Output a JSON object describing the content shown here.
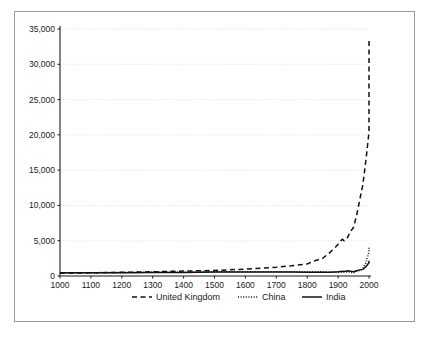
{
  "chart_data": {
    "type": "line",
    "title": "",
    "subtitle": "",
    "xlabel": "",
    "ylabel": "",
    "xlim": [
      1000,
      2000
    ],
    "ylim": [
      0,
      35000
    ],
    "grid": true,
    "legend_position": "bottom",
    "x_ticks": [
      1000,
      1100,
      1200,
      1300,
      1400,
      1500,
      1600,
      1700,
      1800,
      1900,
      2000
    ],
    "x_tick_labels": [
      "1000",
      "1100",
      "1200",
      "1300",
      "1400",
      "1500",
      "1600",
      "1700",
      "1800",
      "1900",
      "2000"
    ],
    "y_ticks": [
      0,
      5000,
      10000,
      15000,
      20000,
      25000,
      30000,
      35000
    ],
    "y_tick_labels": [
      "0",
      "5,000",
      "10,000",
      "15,000",
      "20,000",
      "25,000",
      "30,000",
      "35,000"
    ],
    "series": [
      {
        "name": "United Kingdom",
        "style": "dashed",
        "color": "#111111",
        "x": [
          1000,
          1100,
          1200,
          1300,
          1400,
          1500,
          1600,
          1700,
          1750,
          1800,
          1820,
          1850,
          1870,
          1890,
          1900,
          1913,
          1920,
          1930,
          1940,
          1950,
          1960,
          1970,
          1980,
          1990,
          2000,
          2003
        ],
        "values": [
          400,
          450,
          520,
          600,
          700,
          780,
          980,
          1250,
          1450,
          1700,
          2100,
          2500,
          3200,
          4000,
          4500,
          5200,
          5000,
          5400,
          6300,
          6900,
          8600,
          10800,
          12900,
          16400,
          20400,
          33800
        ]
      },
      {
        "name": "China",
        "style": "dotted",
        "color": "#111111",
        "x": [
          1000,
          1100,
          1200,
          1300,
          1400,
          1500,
          1600,
          1700,
          1750,
          1800,
          1850,
          1870,
          1890,
          1900,
          1913,
          1920,
          1930,
          1940,
          1950,
          1960,
          1970,
          1980,
          1990,
          2000,
          2003
        ],
        "values": [
          450,
          470,
          500,
          520,
          540,
          600,
          600,
          600,
          600,
          600,
          600,
          530,
          540,
          545,
          552,
          550,
          560,
          570,
          440,
          660,
          780,
          1060,
          1860,
          3420,
          4200
        ]
      },
      {
        "name": "India",
        "style": "solid",
        "color": "#111111",
        "x": [
          1000,
          1100,
          1200,
          1300,
          1400,
          1500,
          1600,
          1700,
          1750,
          1800,
          1850,
          1870,
          1890,
          1900,
          1913,
          1920,
          1930,
          1940,
          1950,
          1960,
          1970,
          1980,
          1990,
          2000,
          2003
        ],
        "values": [
          450,
          460,
          470,
          480,
          500,
          550,
          550,
          550,
          550,
          533,
          533,
          533,
          584,
          599,
          673,
          635,
          726,
          686,
          619,
          753,
          868,
          938,
          1309,
          1892,
          2160
        ]
      }
    ],
    "legend": [
      {
        "label": "United Kingdom",
        "style": "dashed"
      },
      {
        "label": "China",
        "style": "dotted"
      },
      {
        "label": "India",
        "style": "solid"
      }
    ]
  }
}
